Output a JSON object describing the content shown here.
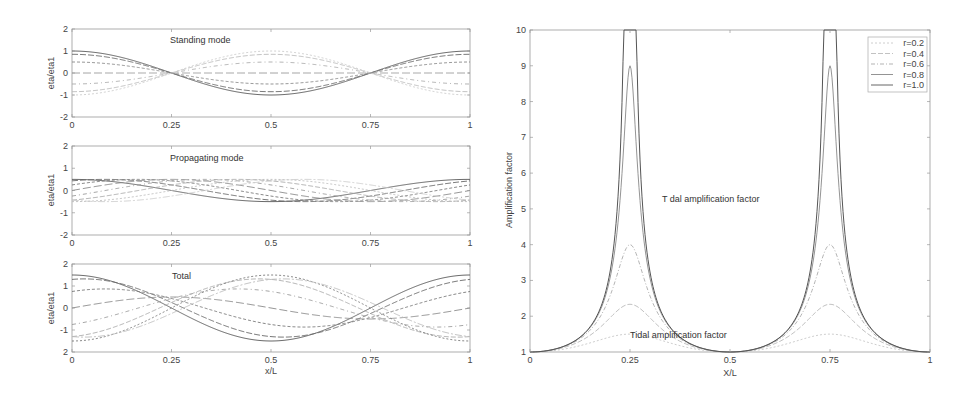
{
  "chart_data": [
    {
      "id": "standing",
      "type": "line",
      "title": "",
      "annotation": "Standing mode",
      "xlabel": "",
      "ylabel": "eta/eta1",
      "xlim": [
        0,
        1
      ],
      "ylim": [
        -2,
        2
      ],
      "xticks": [
        0,
        0.25,
        0.5,
        0.75,
        1
      ],
      "xtick_labels": [
        "0",
        "0.25",
        "0.5",
        "0.75",
        "1"
      ],
      "yticks": [
        -2,
        -1,
        0,
        1,
        2
      ],
      "ytick_labels": [
        "-2",
        "-1",
        "0",
        "1",
        "2"
      ],
      "grid": false,
      "formula": "A*cos(2*pi*x)",
      "series": [
        {
          "name": "phase 0",
          "amplitude": 1.0,
          "color": "#555555"
        },
        {
          "name": "phase 1",
          "amplitude": 0.85,
          "color": "#666666"
        },
        {
          "name": "phase 2",
          "amplitude": 0.5,
          "color": "#888888"
        },
        {
          "name": "phase 3",
          "amplitude": 0.0,
          "color": "#999999"
        },
        {
          "name": "phase 4",
          "amplitude": -0.5,
          "color": "#aaaaaa"
        },
        {
          "name": "phase 5",
          "amplitude": -0.85,
          "color": "#bbbbbb"
        },
        {
          "name": "phase 6",
          "amplitude": -1.0,
          "color": "#cccccc"
        }
      ]
    },
    {
      "id": "propagating",
      "type": "line",
      "title": "",
      "annotation": "Propagating mode",
      "xlabel": "",
      "ylabel": "eta/eta1",
      "xlim": [
        0,
        1
      ],
      "ylim": [
        -2,
        2
      ],
      "xticks": [
        0,
        0.25,
        0.5,
        0.75,
        1
      ],
      "xtick_labels": [
        "0",
        "0.25",
        "0.5",
        "0.75",
        "1"
      ],
      "yticks": [
        -2,
        -1,
        0,
        1,
        2
      ],
      "ytick_labels": [
        "-2",
        "-1",
        "0",
        "1",
        "2"
      ],
      "grid": false,
      "formula": "0.5*cos(2*pi*x - phase)",
      "amplitude": 0.5,
      "series": [
        {
          "name": "phase 0",
          "phase_deg": 0,
          "color": "#555555"
        },
        {
          "name": "phase 1",
          "phase_deg": 30,
          "color": "#666666"
        },
        {
          "name": "phase 2",
          "phase_deg": 60,
          "color": "#777777"
        },
        {
          "name": "phase 3",
          "phase_deg": 90,
          "color": "#888888"
        },
        {
          "name": "phase 4",
          "phase_deg": 120,
          "color": "#999999"
        },
        {
          "name": "phase 5",
          "phase_deg": 150,
          "color": "#aaaaaa"
        },
        {
          "name": "phase 6",
          "phase_deg": 180,
          "color": "#bbbbbb"
        },
        {
          "name": "phase 7",
          "phase_deg": 210,
          "color": "#cccccc"
        }
      ]
    },
    {
      "id": "total",
      "type": "line",
      "title": "",
      "annotation": "Total",
      "xlabel": "x/L",
      "ylabel": "eta/eta1",
      "xlim": [
        0,
        1
      ],
      "ylim": [
        -2,
        2
      ],
      "xticks": [
        0,
        0.25,
        0.5,
        0.75,
        1
      ],
      "xtick_labels": [
        "0",
        "0.25",
        "0.5",
        "0.75",
        "1"
      ],
      "yticks": [
        -2,
        -1,
        0,
        1,
        2
      ],
      "ytick_labels": [
        "2",
        "-1",
        "0",
        "1",
        "2"
      ],
      "grid": false,
      "formula": "cos(t)*cos(2*pi*x) + 0.5*cos(2*pi*x - t)",
      "series": [
        {
          "name": "t=0",
          "phase_deg": 0,
          "color": "#555555"
        },
        {
          "name": "t=30",
          "phase_deg": 30,
          "color": "#666666"
        },
        {
          "name": "t=60",
          "phase_deg": 60,
          "color": "#777777"
        },
        {
          "name": "t=90",
          "phase_deg": 90,
          "color": "#888888"
        },
        {
          "name": "t=120",
          "phase_deg": 120,
          "color": "#999999"
        },
        {
          "name": "t=150",
          "phase_deg": 150,
          "color": "#aaaaaa"
        },
        {
          "name": "t=180",
          "phase_deg": 180,
          "color": "#777777"
        },
        {
          "name": "t=210",
          "phase_deg": 210,
          "color": "#bbbbbb"
        }
      ]
    },
    {
      "id": "amplification",
      "type": "line",
      "title": "",
      "annotations": [
        "T dal amplification factor",
        "Tidal amplification factor"
      ],
      "xlabel": "X/L",
      "ylabel": "Amplification factor",
      "xlim": [
        0,
        1
      ],
      "ylim": [
        1,
        10
      ],
      "xticks": [
        0,
        0.25,
        0.5,
        0.75,
        1
      ],
      "xtick_labels": [
        "0",
        "0.25",
        "0.5",
        "0.75",
        "1"
      ],
      "yticks": [
        1,
        2,
        3,
        4,
        5,
        6,
        7,
        8,
        9,
        10
      ],
      "ytick_labels": [
        "1",
        "2",
        "3",
        "4",
        "5",
        "6",
        "7",
        "8",
        "9",
        "10"
      ],
      "grid": false,
      "legend_position": "upper right",
      "formula": "sqrt((1+r^2+2r)/(1+r^2 + 2r*cos(4*pi*x)))",
      "series": [
        {
          "name": "r=0.2",
          "r": 0.2,
          "peak": 1.5,
          "color": "#c8c8c8"
        },
        {
          "name": "r=0.4",
          "r": 0.4,
          "peak": 2.33,
          "color": "#bbbbbb"
        },
        {
          "name": "r=0.6",
          "r": 0.6,
          "peak": 4.0,
          "color": "#aaaaaa"
        },
        {
          "name": "r=0.8",
          "r": 0.8,
          "peak": 9.0,
          "color": "#888888"
        },
        {
          "name": "r=1.0",
          "r": 1.0,
          "peak": "infinite",
          "color": "#555555"
        }
      ]
    }
  ],
  "legend": {
    "entries": [
      "r=0.2",
      "r=0.4",
      "r=0.6",
      "r=0.8",
      "r=1.0"
    ]
  }
}
